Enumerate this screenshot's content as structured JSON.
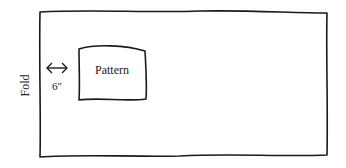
{
  "diagram": {
    "fold_label": "Fold",
    "pattern_label": "Pattern",
    "distance_label": "6″",
    "stroke_color": "#1a1a1a",
    "background": "#ffffff"
  }
}
